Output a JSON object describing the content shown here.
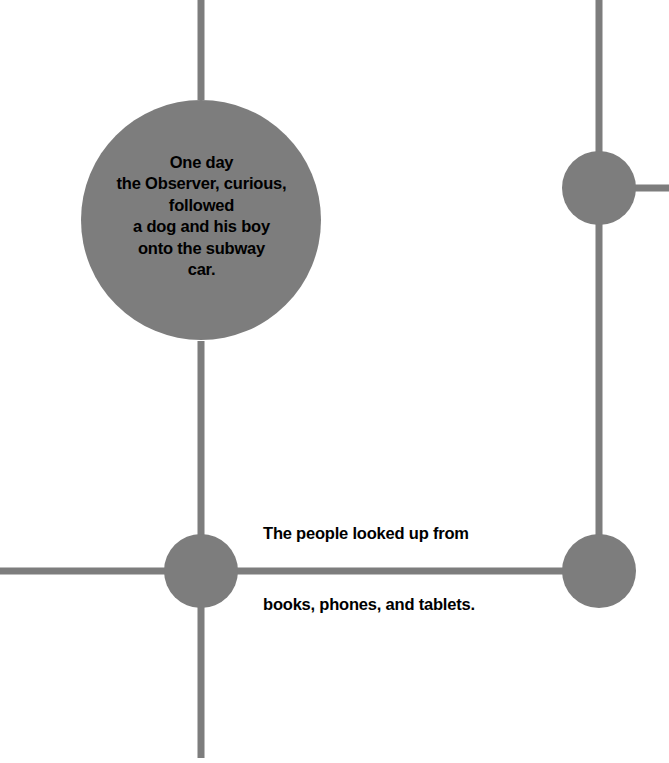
{
  "canvas": {
    "width": 669,
    "height": 763,
    "background_color": "#ffffff"
  },
  "style": {
    "node_color": "#7d7d7d",
    "edge_color": "#7d7d7d",
    "text_color": "#000000",
    "edge_width": 7
  },
  "nodes": [
    {
      "id": "observer-subway",
      "name": "main-story-node",
      "cx": 201,
      "cy": 220,
      "r": 120,
      "text": "One day\nthe Observer, curious,\nfollowed\na dog and his boy\nonto the subway\ncar."
    },
    {
      "id": "junction-upper-right",
      "name": "upper-right-node",
      "cx": 599,
      "cy": 188,
      "r": 37,
      "text": ""
    },
    {
      "id": "junction-lower-left",
      "name": "lower-left-node",
      "cx": 201,
      "cy": 571,
      "r": 37,
      "text": ""
    },
    {
      "id": "junction-lower-right",
      "name": "lower-right-node",
      "cx": 599,
      "cy": 571,
      "r": 37,
      "text": ""
    }
  ],
  "edges": [
    {
      "name": "edge-top-to-main",
      "x1": 201,
      "y1": 0,
      "x2": 201,
      "y2": 100
    },
    {
      "name": "edge-main-to-lower-left",
      "x1": 201,
      "y1": 341,
      "x2": 201,
      "y2": 571
    },
    {
      "name": "edge-lower-left-to-bottom",
      "x1": 201,
      "y1": 571,
      "x2": 201,
      "y2": 758
    },
    {
      "name": "edge-lower-left-to-left-margin",
      "x1": 0,
      "y1": 571,
      "x2": 201,
      "y2": 571
    },
    {
      "name": "edge-lower-left-to-lower-right",
      "x1": 201,
      "y1": 571,
      "x2": 599,
      "y2": 571
    },
    {
      "name": "edge-top-to-upper-right",
      "x1": 599,
      "y1": 0,
      "x2": 599,
      "y2": 188
    },
    {
      "name": "edge-upper-right-to-right-margin",
      "x1": 599,
      "y1": 188,
      "x2": 669,
      "y2": 188
    },
    {
      "name": "edge-upper-right-to-lower-right",
      "x1": 599,
      "y1": 188,
      "x2": 599,
      "y2": 571
    }
  ],
  "edge_labels": [
    {
      "id": "people-looked-up",
      "name": "edge-label-people-looked-up",
      "text": "The people looked up from",
      "x": 263,
      "y": 524
    },
    {
      "id": "books-phones-tablets",
      "name": "edge-label-books-phones-tablets",
      "text": "books, phones, and tablets.",
      "x": 263,
      "y": 595
    }
  ]
}
